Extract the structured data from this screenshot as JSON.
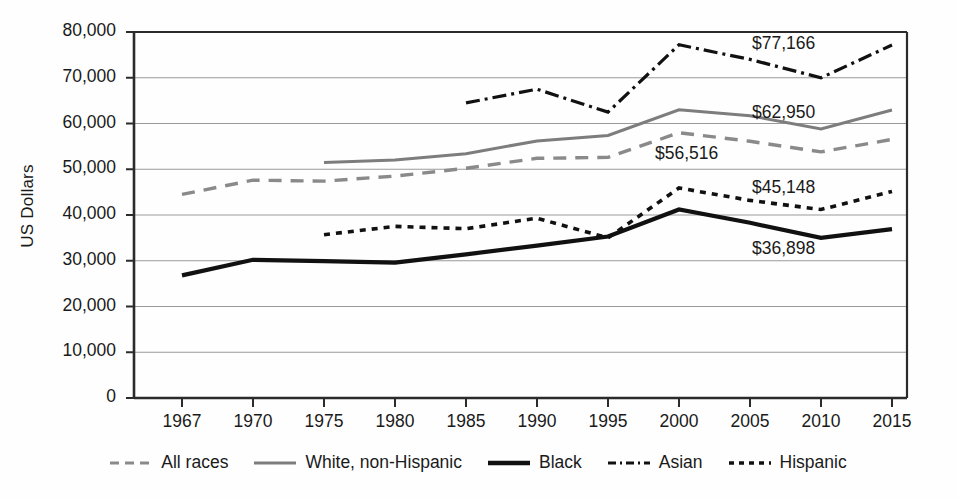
{
  "chart_data": {
    "type": "line",
    "title": "",
    "xlabel": "",
    "ylabel": "US Dollars",
    "categories": [
      "1967",
      "1970",
      "1975",
      "1980",
      "1985",
      "1990",
      "1995",
      "2000",
      "2005",
      "2010",
      "2015"
    ],
    "ylim": [
      0,
      80000
    ],
    "ytick_labels": [
      "80,000",
      "70,000",
      "60,000",
      "50,000",
      "40,000",
      "30,000",
      "20,000",
      "10,000",
      "0"
    ],
    "ytick_values": [
      80000,
      70000,
      60000,
      50000,
      40000,
      30000,
      20000,
      10000,
      0
    ],
    "grid": "horizontal",
    "legend_position": "bottom",
    "series": [
      {
        "name": "All races",
        "style": "dashed",
        "color": "#8a8a8a",
        "end_label": "$56,516",
        "x": [
          "1967",
          "1970",
          "1975",
          "1980",
          "1985",
          "1990",
          "1995",
          "2000",
          "2005",
          "2010",
          "2015"
        ],
        "values": [
          44500,
          47600,
          47400,
          48500,
          50200,
          52400,
          52600,
          58000,
          56100,
          53800,
          56516
        ]
      },
      {
        "name": "White, non-Hispanic",
        "style": "solid",
        "color": "#7d7d7d",
        "end_label": "$62,950",
        "x": [
          "1975",
          "1980",
          "1985",
          "1990",
          "1995",
          "2000",
          "2005",
          "2010",
          "2015"
        ],
        "values": [
          51500,
          52000,
          53400,
          56200,
          57400,
          63000,
          61700,
          58800,
          62950
        ]
      },
      {
        "name": "Black",
        "style": "solid-thick",
        "color": "#111111",
        "end_label": "$36,898",
        "x": [
          "1967",
          "1970",
          "1975",
          "1980",
          "1985",
          "1990",
          "1995",
          "2000",
          "2005",
          "2010",
          "2015"
        ],
        "values": [
          26800,
          30200,
          29900,
          29600,
          31400,
          33300,
          35300,
          41200,
          38300,
          35000,
          36898
        ]
      },
      {
        "name": "Asian",
        "style": "dash-dot",
        "color": "#111111",
        "end_label": "$77,166",
        "x": [
          "1985",
          "1990",
          "1995",
          "2000",
          "2005",
          "2010",
          "2015"
        ],
        "values": [
          64500,
          67500,
          62500,
          77200,
          74000,
          70000,
          77166
        ]
      },
      {
        "name": "Hispanic",
        "style": "dotted",
        "color": "#111111",
        "end_label": "$45,148",
        "x": [
          "1975",
          "1980",
          "1985",
          "1990",
          "1995",
          "2000",
          "2005",
          "2010",
          "2015"
        ],
        "values": [
          35700,
          37500,
          37000,
          39300,
          35000,
          45900,
          43200,
          41200,
          45148
        ]
      }
    ],
    "data_labels": [
      {
        "text": "$77,166",
        "series": "Asian"
      },
      {
        "text": "$62,950",
        "series": "White, non-Hispanic"
      },
      {
        "text": "$56,516",
        "series": "All races"
      },
      {
        "text": "$45,148",
        "series": "Hispanic"
      },
      {
        "text": "$36,898",
        "series": "Black"
      }
    ]
  },
  "legend": {
    "items": [
      {
        "label": "All races"
      },
      {
        "label": "White, non-Hispanic"
      },
      {
        "label": "Black"
      },
      {
        "label": "Asian"
      },
      {
        "label": "Hispanic"
      }
    ]
  },
  "axis": {
    "y_title": "US Dollars",
    "y_ticks": [
      "80,000",
      "70,000",
      "60,000",
      "50,000",
      "40,000",
      "30,000",
      "20,000",
      "10,000",
      "0"
    ],
    "x_ticks": [
      "1967",
      "1970",
      "1975",
      "1980",
      "1985",
      "1990",
      "1995",
      "2000",
      "2005",
      "2010",
      "2015"
    ]
  },
  "labels": {
    "asian": "$77,166",
    "white": "$62,950",
    "all_races": "$56,516",
    "hispanic": "$45,148",
    "black": "$36,898"
  },
  "colors": {
    "gray_series": "#8a8a8a",
    "black_series": "#111111",
    "gridline": "#9a9a9a",
    "axis": "#2b2b2b"
  }
}
